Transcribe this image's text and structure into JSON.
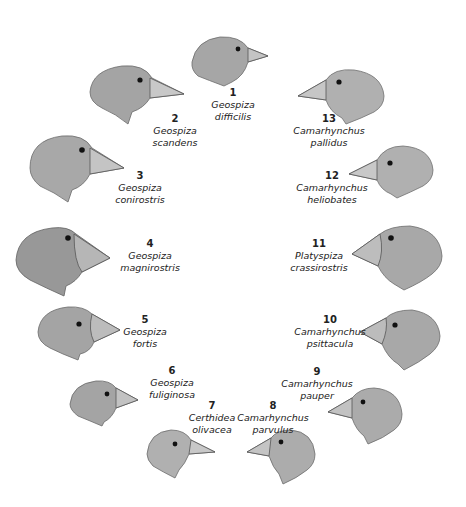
{
  "figure": {
    "species": [
      {
        "num": "1",
        "genus": "Geospiza",
        "species": "difficilis"
      },
      {
        "num": "2",
        "genus": "Geospiza",
        "species": "scandens"
      },
      {
        "num": "3",
        "genus": "Geospiza",
        "species": "conirostris"
      },
      {
        "num": "4",
        "genus": "Geospiza",
        "species": "magnirostris"
      },
      {
        "num": "5",
        "genus": "Geospiza",
        "species": "fortis"
      },
      {
        "num": "6",
        "genus": "Geospiza",
        "species": "fuliginosa"
      },
      {
        "num": "7",
        "genus": "Certhidea",
        "species": "olivacea"
      },
      {
        "num": "8",
        "genus": "Camarhynchus",
        "species": "parvulus"
      },
      {
        "num": "9",
        "genus": "Camarhynchus",
        "species": "pauper"
      },
      {
        "num": "10",
        "genus": "Camarhynchus",
        "species": "psittacula"
      },
      {
        "num": "11",
        "genus": "Platyspiza",
        "species": "crassirostris"
      },
      {
        "num": "12",
        "genus": "Camarhynchus",
        "species": "heliobates"
      },
      {
        "num": "13",
        "genus": "Camarhynchus",
        "species": "pallidus"
      }
    ]
  },
  "colors": {
    "ink": "#222222",
    "feather": "#8a8a8a",
    "beak": "#9a9a9a",
    "background": "#ffffff"
  }
}
